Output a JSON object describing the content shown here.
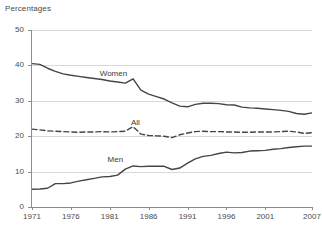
{
  "chart_data": {
    "type": "line",
    "title": "Percentages",
    "xlabel": "",
    "ylabel": "",
    "ylim": [
      0,
      50
    ],
    "xlim": [
      1971,
      2007
    ],
    "grid": true,
    "legend_position": "inline-labels",
    "ytick_labels": [
      "0",
      "10",
      "20",
      "30",
      "40",
      "50"
    ],
    "ytick_values": [
      0,
      10,
      20,
      30,
      40,
      50
    ],
    "xtick_labels": [
      "1971",
      "1976",
      "1981",
      "1986",
      "1991",
      "1996",
      "2001",
      "2007"
    ],
    "xtick_values": [
      1971,
      1976,
      1981,
      1986,
      1991,
      1996,
      2001,
      2007
    ],
    "x": [
      1971,
      1972,
      1973,
      1974,
      1975,
      1976,
      1977,
      1978,
      1979,
      1980,
      1981,
      1982,
      1983,
      1984,
      1985,
      1986,
      1987,
      1988,
      1989,
      1990,
      1991,
      1992,
      1993,
      1994,
      1995,
      1996,
      1997,
      1998,
      1999,
      2000,
      2001,
      2002,
      2003,
      2004,
      2005,
      2006,
      2007
    ],
    "series": [
      {
        "name": "Women",
        "style": "solid",
        "color": "#454545",
        "values": [
          40.5,
          40.3,
          39.2,
          38.3,
          37.6,
          37.2,
          36.9,
          36.6,
          36.3,
          36.0,
          35.6,
          35.3,
          35.0,
          36.2,
          33.0,
          31.9,
          31.2,
          30.5,
          29.4,
          28.5,
          28.3,
          29.0,
          29.3,
          29.3,
          29.2,
          28.9,
          28.8,
          28.2,
          28.0,
          27.9,
          27.7,
          27.5,
          27.3,
          27.0,
          26.4,
          26.2,
          26.6
        ],
        "label_x": 1981,
        "label_y": 37.5
      },
      {
        "name": "All",
        "style": "dashed",
        "color": "#454545",
        "values": [
          22.0,
          21.8,
          21.5,
          21.4,
          21.3,
          21.2,
          21.1,
          21.2,
          21.2,
          21.3,
          21.2,
          21.3,
          21.4,
          22.7,
          20.6,
          20.2,
          20.1,
          20.0,
          19.6,
          20.4,
          20.9,
          21.3,
          21.4,
          21.3,
          21.3,
          21.2,
          21.2,
          21.1,
          21.1,
          21.2,
          21.2,
          21.2,
          21.3,
          21.4,
          21.2,
          20.8,
          21.0
        ],
        "label_x": 1985,
        "label_y": 23.8
      },
      {
        "name": "Men",
        "style": "solid",
        "color": "#454545",
        "values": [
          5.0,
          5.1,
          5.3,
          6.6,
          6.6,
          6.8,
          7.3,
          7.7,
          8.1,
          8.5,
          8.6,
          9.0,
          10.7,
          11.6,
          11.4,
          11.5,
          11.5,
          11.5,
          10.6,
          11.0,
          12.4,
          13.6,
          14.3,
          14.6,
          15.1,
          15.5,
          15.3,
          15.4,
          15.8,
          15.9,
          16.0,
          16.3,
          16.5,
          16.8,
          17.0,
          17.2,
          17.2
        ],
        "label_x": 1982,
        "label_y": 13.4
      }
    ]
  },
  "colors": {
    "grid": "#d8d8d8",
    "axis": "#8c8c8c",
    "line": "#454545",
    "text": "#4a4a4a",
    "background": "#ffffff"
  }
}
